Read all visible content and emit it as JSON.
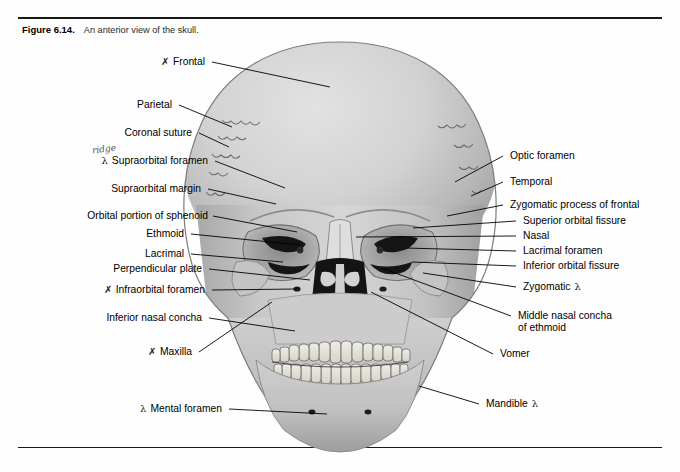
{
  "figure": {
    "number": "Figure 6.14.",
    "caption": "An anterior view of the skull."
  },
  "labels_left": [
    {
      "id": "frontal",
      "text": "Frontal",
      "mark": "✗",
      "x": 205,
      "y": 62,
      "lx": 212,
      "ly": 62,
      "tx": 330,
      "ty": 87
    },
    {
      "id": "parietal",
      "text": "Parietal",
      "mark": "",
      "x": 172,
      "y": 105,
      "lx": 179,
      "ly": 105,
      "tx": 232,
      "ty": 127
    },
    {
      "id": "coronal-suture",
      "text": "Coronal suture",
      "mark": "",
      "x": 192,
      "y": 133,
      "lx": 199,
      "ly": 133,
      "tx": 229,
      "ty": 147
    },
    {
      "id": "supraorbital-foramen",
      "text": "Supraorbital foramen",
      "mark": "λ",
      "x": 208,
      "y": 161,
      "lx": 215,
      "ly": 161,
      "tx": 285,
      "ty": 188
    },
    {
      "id": "supraorbital-margin",
      "text": "Supraorbital margin",
      "mark": "",
      "x": 201,
      "y": 189,
      "lx": 208,
      "ly": 189,
      "tx": 276,
      "ty": 204
    },
    {
      "id": "orbital-sphenoid",
      "text": "Orbital portion of sphenoid",
      "mark": "",
      "x": 208,
      "y": 216,
      "lx": 213,
      "ly": 216,
      "tx": 297,
      "ty": 232
    },
    {
      "id": "ethmoid",
      "text": "Ethmoid",
      "mark": "",
      "x": 184,
      "y": 234,
      "lx": 191,
      "ly": 234,
      "tx": 300,
      "ty": 245
    },
    {
      "id": "lacrimal",
      "text": "Lacrimal",
      "mark": "",
      "x": 184,
      "y": 254,
      "lx": 191,
      "ly": 254,
      "tx": 283,
      "ty": 262
    },
    {
      "id": "perpendicular-plate",
      "text": "Perpendicular plate",
      "mark": "",
      "x": 202,
      "y": 269,
      "lx": 209,
      "ly": 269,
      "tx": 310,
      "ty": 280
    },
    {
      "id": "infraorbital-foramen",
      "text": "Infraorbital foramen",
      "mark": "✗",
      "x": 205,
      "y": 290,
      "lx": 212,
      "ly": 290,
      "tx": 297,
      "ty": 289
    },
    {
      "id": "inferior-nasal-concha",
      "text": "Inferior nasal concha",
      "mark": "",
      "x": 202,
      "y": 318,
      "lx": 209,
      "ly": 318,
      "tx": 295,
      "ty": 331
    },
    {
      "id": "maxilla",
      "text": "Maxilla",
      "mark": "✗",
      "x": 192,
      "y": 352,
      "lx": 199,
      "ly": 352,
      "tx": 272,
      "ty": 302
    },
    {
      "id": "mental-foramen",
      "text": "Mental foramen",
      "mark": "λ",
      "x": 222,
      "y": 409,
      "lx": 229,
      "ly": 409,
      "tx": 327,
      "ty": 414
    }
  ],
  "labels_right": [
    {
      "id": "optic-foramen",
      "text": "Optic foramen",
      "mark": "",
      "x": 510,
      "y": 156,
      "lx": 503,
      "ly": 156,
      "tx": 455,
      "ty": 182
    },
    {
      "id": "temporal",
      "text": "Temporal",
      "mark": "",
      "x": 510,
      "y": 182,
      "lx": 503,
      "ly": 182,
      "tx": 471,
      "ty": 196
    },
    {
      "id": "zygomatic-process-frontal",
      "text": "Zygomatic process of frontal",
      "mark": "",
      "x": 510,
      "y": 205,
      "lx": 503,
      "ly": 205,
      "tx": 447,
      "ty": 216
    },
    {
      "id": "superior-orbital-fissure",
      "text": "Superior orbital fissure",
      "mark": "",
      "x": 523,
      "y": 221,
      "lx": 516,
      "ly": 221,
      "tx": 413,
      "ty": 228
    },
    {
      "id": "nasal",
      "text": "Nasal",
      "mark": "",
      "x": 523,
      "y": 236,
      "lx": 516,
      "ly": 236,
      "tx": 356,
      "ty": 237
    },
    {
      "id": "lacrimal-foramen",
      "text": "Lacrimal foramen",
      "mark": "",
      "x": 523,
      "y": 251,
      "lx": 516,
      "ly": 251,
      "tx": 405,
      "ty": 248
    },
    {
      "id": "inferior-orbital-fissure",
      "text": "Inferior orbital fissure",
      "mark": "",
      "x": 523,
      "y": 266,
      "lx": 516,
      "ly": 266,
      "tx": 412,
      "ty": 262
    },
    {
      "id": "zygomatic",
      "text": "Zygomatic",
      "mark": "λ",
      "x": 523,
      "y": 287,
      "lx": 516,
      "ly": 287,
      "tx": 423,
      "ty": 273
    },
    {
      "id": "middle-nasal-concha",
      "text": "Middle nasal concha",
      "mark": "",
      "sub": "of ethmoid",
      "x": 518,
      "y": 316,
      "lx": 511,
      "ly": 316,
      "tx": 382,
      "ty": 268
    },
    {
      "id": "vomer",
      "text": "Vomer",
      "mark": "",
      "x": 500,
      "y": 354,
      "lx": 493,
      "ly": 354,
      "tx": 371,
      "ty": 292
    },
    {
      "id": "mandible",
      "text": "Mandible",
      "mark": "λ",
      "x": 486,
      "y": 404,
      "lx": 479,
      "ly": 404,
      "tx": 419,
      "ty": 386
    }
  ],
  "annotations": [
    {
      "id": "ridge-note",
      "text": "ridge",
      "x": 92,
      "y": 144
    }
  ],
  "colors": {
    "ink": "#000000",
    "rule": "#1a1a1a",
    "cranium_light": "#d8d8d8",
    "cranium_mid": "#bdbdbd",
    "cranium_shadow": "#9a9a9a",
    "cavity_black": "#111111",
    "tooth": "#e8e6de",
    "background": "#fefefe"
  }
}
